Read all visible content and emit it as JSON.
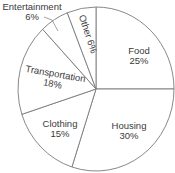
{
  "chart_data": {
    "type": "pie",
    "title": "",
    "start_angle_deg": 0,
    "direction": "clockwise",
    "slices": [
      {
        "label": "Food",
        "value": 25,
        "display": "25%"
      },
      {
        "label": "Housing",
        "value": 30,
        "display": "30%"
      },
      {
        "label": "Clothing",
        "value": 15,
        "display": "15%"
      },
      {
        "label": "Transportation",
        "value": 18,
        "display": "18%"
      },
      {
        "label": "Entertainment",
        "value": 6,
        "display": "6%"
      },
      {
        "label": "Other",
        "value": 6,
        "display": "6%"
      }
    ],
    "colors": {
      "fill": "#ffffff",
      "stroke": "#7a7a7a",
      "text": "#3a3a3a"
    }
  }
}
